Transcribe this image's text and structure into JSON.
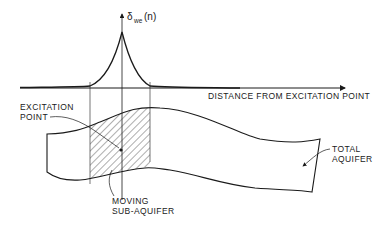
{
  "diagram": {
    "y_axis_label": {
      "symbol": "δ",
      "subscript": "we",
      "argument": "(n)"
    },
    "x_axis_label": "DISTANCE FROM EXCITATION POINT",
    "labels": {
      "excitation_point_line1": "EXCITATION",
      "excitation_point_line2": "POINT",
      "moving_sub_aquifer_line1": "MOVING",
      "moving_sub_aquifer_line2": "SUB-AQUIFER",
      "total_aquifer_line1": "TOTAL",
      "total_aquifer_line2": "AQUIFER"
    },
    "colors": {
      "ink": "#1a1a1a",
      "background": "#ffffff"
    }
  }
}
